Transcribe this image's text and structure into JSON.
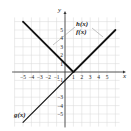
{
  "chart_data": {
    "type": "line",
    "title": "",
    "xlabel": "x",
    "ylabel": "y",
    "xlim": [
      -6,
      6.5
    ],
    "ylim": [
      -6.5,
      6.5
    ],
    "grid": true,
    "x_ticks": [
      "-5",
      "-4",
      "-3",
      "-2",
      "-1",
      "1",
      "2",
      "3",
      "4",
      "5"
    ],
    "y_ticks": [
      "5",
      "4",
      "3",
      "2",
      "1",
      "-1",
      "-3",
      "-4",
      "-5"
    ],
    "series": [
      {
        "name": "h(x)",
        "points": [
          [
            -5,
            6
          ],
          [
            1,
            0
          ]
        ],
        "style": "thick"
      },
      {
        "name": "f(x)",
        "points": [
          [
            1,
            0
          ],
          [
            6,
            5
          ]
        ],
        "style": "thick"
      },
      {
        "name": "g(x)",
        "points": [
          [
            -5,
            -6
          ],
          [
            1,
            0
          ]
        ],
        "style": "thin"
      }
    ],
    "annotations": [
      {
        "text": "h(x)",
        "at": [
          4,
          5.3
        ],
        "points_to": [
          -2,
          3
        ]
      },
      {
        "text": "f(x)",
        "at": [
          4,
          4
        ],
        "points_to": [
          5,
          3.5
        ]
      },
      {
        "text": "g(x)",
        "at": [
          -5.5,
          -4.2
        ]
      }
    ]
  },
  "labels": {
    "x_axis": "x",
    "y_axis": "y",
    "h": "h(x)",
    "f": "f(x)",
    "g": "g(x)"
  }
}
